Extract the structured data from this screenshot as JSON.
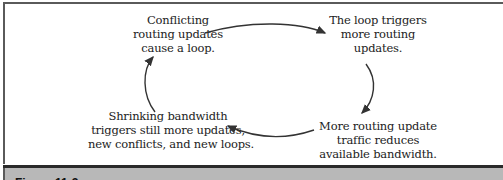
{
  "diagram": {
    "nodes": [
      {
        "id": "conflicting",
        "lines": [
          "Conflicting",
          "routing updates",
          "cause a loop."
        ]
      },
      {
        "id": "loop-triggers",
        "lines": [
          "The loop triggers",
          "more routing",
          "updates."
        ]
      },
      {
        "id": "more-traffic",
        "lines": [
          "More routing update",
          "traffic reduces",
          "available bandwidth."
        ]
      },
      {
        "id": "shrinking",
        "lines": [
          "Shrinking bandwidth",
          "triggers still more updates,",
          "new conflicts, and new loops."
        ]
      }
    ],
    "edges": [
      {
        "from": "conflicting",
        "to": "loop-triggers"
      },
      {
        "from": "loop-triggers",
        "to": "more-traffic"
      },
      {
        "from": "more-traffic",
        "to": "shrinking"
      },
      {
        "from": "shrinking",
        "to": "conflicting"
      }
    ]
  },
  "caption": {
    "label": "Figure 11-3"
  },
  "colors": {
    "arrow": "#333333",
    "caption_bg": "#b8b8b8",
    "border": "#5a5a5a"
  }
}
